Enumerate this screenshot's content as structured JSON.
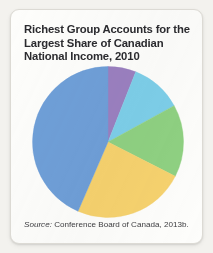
{
  "figure": {
    "title": "Richest Group Accounts for the Largest Share of Canadian National Income, 2010",
    "source_label": "Source:",
    "source_text": " Conference Board of Canada, 2013b."
  },
  "chart_data": {
    "type": "pie",
    "title": "Richest Group Accounts for the Largest Share of Canadian National Income, 2010",
    "xlabel": "",
    "ylabel": "",
    "legend_position": "none",
    "grid": false,
    "start_angle_deg": 0,
    "direction": "clockwise",
    "categories": [
      "Lowest income quintile",
      "Second income quintile",
      "Middle income quintile",
      "Fourth income quintile",
      "Highest income quintile"
    ],
    "values": [
      6,
      11,
      15.5,
      24,
      43.5
    ],
    "units": "percent of national income",
    "slices": [
      {
        "label": "Lowest income quintile",
        "value": 6,
        "color": "#9b80c0",
        "start_deg": 0,
        "end_deg": 21.6
      },
      {
        "label": "Second income quintile",
        "value": 11,
        "color": "#7dcfe9",
        "start_deg": 21.6,
        "end_deg": 61.2
      },
      {
        "label": "Middle income quintile",
        "value": 15.5,
        "color": "#8fd182",
        "start_deg": 61.2,
        "end_deg": 117.0
      },
      {
        "label": "Fourth income quintile",
        "value": 24,
        "color": "#f6d26e",
        "start_deg": 117.0,
        "end_deg": 203.4
      },
      {
        "label": "Highest income quintile",
        "value": 43.5,
        "color": "#6f9fd8",
        "start_deg": 203.4,
        "end_deg": 360.0
      }
    ]
  },
  "colors": {
    "card_background": "#fdfdfb",
    "page_background": "#f3f2ee",
    "title_text": "#2b2b2f",
    "source_text": "#3d3d40",
    "slice_purple": "#9b80c0",
    "slice_cyan": "#7dcfe9",
    "slice_green": "#8fd182",
    "slice_yellow": "#f6d26e",
    "slice_blue": "#6f9fd8"
  }
}
